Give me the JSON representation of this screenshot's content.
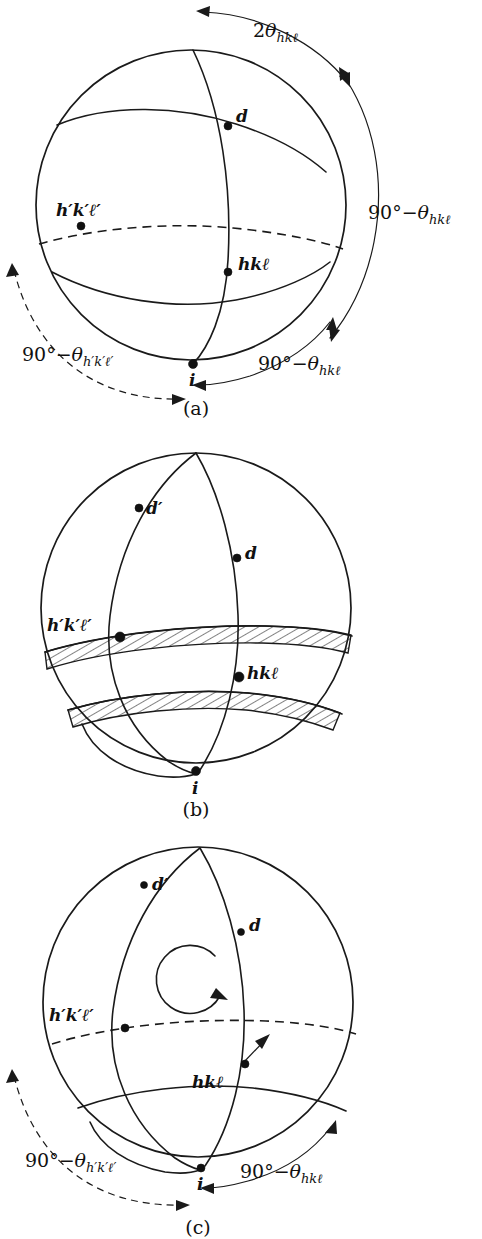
{
  "figure": {
    "background_color": "#ffffff",
    "ink_color": "#111111"
  },
  "glyphs": {
    "theta": "θ",
    "degree": "°",
    "minus": "−",
    "script_l": "ℓ",
    "prime": "′"
  },
  "panels": [
    {
      "id": "a",
      "caption": "(a)",
      "points": [
        {
          "name": "d",
          "label": "d",
          "label_parts": {
            "base": "d",
            "primes": ""
          }
        },
        {
          "name": "hkl",
          "label": "hkℓ",
          "label_parts": {
            "base": "hkℓ",
            "primes": ""
          }
        },
        {
          "name": "hkl-prime",
          "label": "h′k′ℓ′",
          "label_parts": {
            "base": "h′k′ℓ′",
            "primes": ""
          }
        },
        {
          "name": "i",
          "label": "i",
          "label_parts": {
            "base": "i",
            "primes": ""
          }
        }
      ],
      "angle_labels": [
        {
          "name": "two-theta-hkl",
          "prefix": "2",
          "theta": "θ",
          "subscript": "hkℓ"
        },
        {
          "name": "ninety-minus-theta-hkl-right",
          "prefix": "90°−",
          "theta": "θ",
          "subscript": "hkℓ"
        },
        {
          "name": "ninety-minus-theta-hkl-bottom",
          "prefix": "90°−",
          "theta": "θ",
          "subscript": "hkℓ"
        },
        {
          "name": "ninety-minus-theta-hkl-prime",
          "prefix": "90°−",
          "theta": "θ",
          "subscript": "h′k′ℓ′"
        }
      ]
    },
    {
      "id": "b",
      "caption": "(b)",
      "points": [
        {
          "name": "d-prime",
          "label": "d′"
        },
        {
          "name": "d",
          "label": "d"
        },
        {
          "name": "hkl-prime",
          "label": "h′k′ℓ′"
        },
        {
          "name": "hkl",
          "label": "hkℓ"
        },
        {
          "name": "i",
          "label": "i"
        }
      ],
      "angle_labels": [],
      "bands": [
        {
          "name": "hatched-band-upper",
          "hatch": "diagonal"
        },
        {
          "name": "hatched-band-lower",
          "hatch": "diagonal"
        }
      ]
    },
    {
      "id": "c",
      "caption": "(c)",
      "points": [
        {
          "name": "d-prime",
          "label": "d′"
        },
        {
          "name": "d",
          "label": "d"
        },
        {
          "name": "hkl-prime",
          "label": "h′k′ℓ′"
        },
        {
          "name": "hkl",
          "label": "hkℓ"
        },
        {
          "name": "i",
          "label": "i"
        }
      ],
      "angle_labels": [
        {
          "name": "ninety-minus-theta-hkl-prime",
          "prefix": "90°−",
          "theta": "θ",
          "subscript": "h′k′ℓ′"
        },
        {
          "name": "ninety-minus-theta-hkl",
          "prefix": "90°−",
          "theta": "θ",
          "subscript": "hkℓ"
        }
      ],
      "rotation_arrow": {
        "name": "rotation-arrow",
        "direction": "clockwise"
      }
    }
  ]
}
